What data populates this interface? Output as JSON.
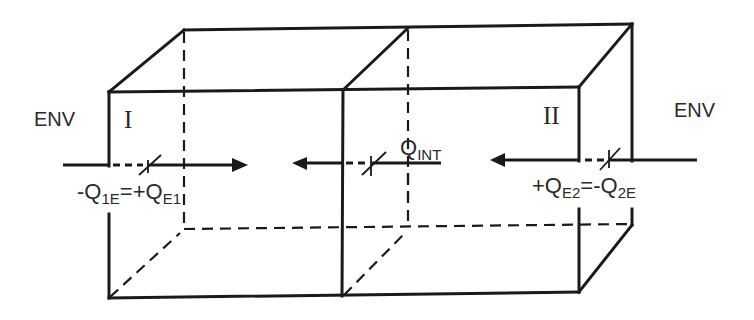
{
  "diagram": {
    "type": "two-zone box with heat flows",
    "colors": {
      "line": "#1a1a1a",
      "text": "#2a2a2a",
      "background": "#ffffff"
    },
    "labels": {
      "env_left": "ENV",
      "env_right": "ENV",
      "zone_1": "I",
      "zone_2": "II",
      "q_int": {
        "main": "Q",
        "sub": "INT"
      },
      "flow_left": {
        "lhs_sign": "-",
        "lhs_main": "Q",
        "lhs_sub": "1E",
        "eq": "=",
        "rhs_sign": "+",
        "rhs_main": "Q",
        "rhs_sub": "E1"
      },
      "flow_right": {
        "lhs_sign": "+",
        "lhs_main": "Q",
        "lhs_sub": "E2",
        "eq": "=",
        "rhs_sign": "-",
        "rhs_main": "Q",
        "rhs_sub": "2E"
      }
    },
    "arrows": [
      {
        "name": "env-to-zone-1",
        "direction": "right"
      },
      {
        "name": "internal-exchange",
        "direction": "left"
      },
      {
        "name": "env-to-zone-2",
        "direction": "left"
      }
    ]
  }
}
